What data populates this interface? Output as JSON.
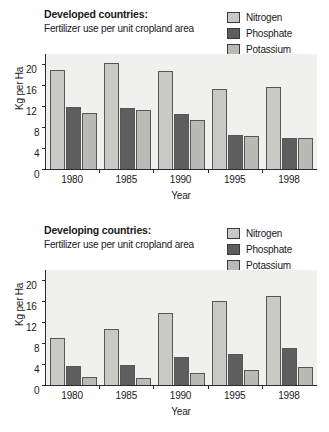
{
  "colors": {
    "nitrogen": "#c9c9c6",
    "phosphate": "#5e5e5e",
    "potassium": "#b9b9b6",
    "plot_background": "#f0f0ee",
    "axis": "#2b2b2b",
    "text": "#1a1a1a"
  },
  "legend": {
    "items": [
      {
        "label": "Nitrogen",
        "color": "#c9c9c6"
      },
      {
        "label": "Phosphate",
        "color": "#5e5e5e"
      },
      {
        "label": "Potassium",
        "color": "#b9b9b6"
      }
    ]
  },
  "panels": [
    {
      "title": "Developed countries:",
      "subtitle": "Fertilizer use per unit cropland area"
    },
    {
      "title": "Developing countries:",
      "subtitle": "Fertilizer use per unit cropland area"
    }
  ],
  "chart_data": [
    {
      "type": "bar",
      "title": "Developed countries: Fertilizer use per unit cropland area",
      "xlabel": "Year",
      "ylabel": "Kg per Ha",
      "categories": [
        "1980",
        "1985",
        "1990",
        "1995",
        "1998"
      ],
      "yticks": [
        0,
        4,
        8,
        12,
        16,
        20
      ],
      "ylim": [
        0,
        22
      ],
      "grid": false,
      "legend_position": "top-right",
      "series": [
        {
          "name": "Nitrogen",
          "color": "#c9c9c6",
          "values": [
            19.0,
            20.3,
            18.7,
            15.4,
            15.6
          ]
        },
        {
          "name": "Phosphate",
          "color": "#5e5e5e",
          "values": [
            11.8,
            11.6,
            10.5,
            6.5,
            6.0
          ]
        },
        {
          "name": "Potassium",
          "color": "#b9b9b6",
          "values": [
            10.7,
            11.2,
            9.4,
            6.3,
            6.0
          ]
        }
      ]
    },
    {
      "type": "bar",
      "title": "Developing countries: Fertilizer use per unit cropland area",
      "xlabel": "Year",
      "ylabel": "Kg per Ha",
      "categories": [
        "1980",
        "1985",
        "1990",
        "1995",
        "1998"
      ],
      "yticks": [
        0,
        4,
        8,
        12,
        16,
        20
      ],
      "ylim": [
        0,
        22
      ],
      "grid": false,
      "legend_position": "top-right",
      "series": [
        {
          "name": "Nitrogen",
          "color": "#c9c9c6",
          "values": [
            8.9,
            10.7,
            13.8,
            16.0,
            17.0
          ]
        },
        {
          "name": "Phosphate",
          "color": "#5e5e5e",
          "values": [
            3.7,
            3.8,
            5.3,
            6.0,
            7.0
          ]
        },
        {
          "name": "Potassium",
          "color": "#b9b9b6",
          "values": [
            1.5,
            1.4,
            2.3,
            2.9,
            3.4
          ]
        }
      ]
    }
  ]
}
